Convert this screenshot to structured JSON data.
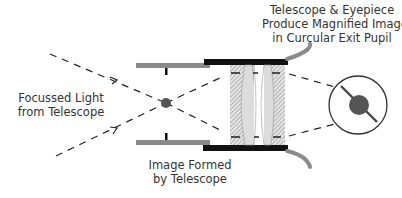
{
  "labels": {
    "exit_pupil": {
      "line1": "Telescope & Eyepiece",
      "line2": "Produce Magnified Image",
      "line3": "in Curcular Exit Pupil"
    },
    "focussed_light": {
      "line1": "Focussed Light",
      "line2": "from Telescope"
    },
    "image_formed": {
      "line1": "Image Formed",
      "line2": "by Telescope"
    }
  },
  "colors": {
    "tube_gray": "#8a8a8a",
    "barrel_black": "#111111",
    "lens_fill": "#d8d8d8",
    "hatch": "#9a9a9a",
    "ray": "#222222",
    "image_dot": "#555555",
    "text": "#333333"
  }
}
